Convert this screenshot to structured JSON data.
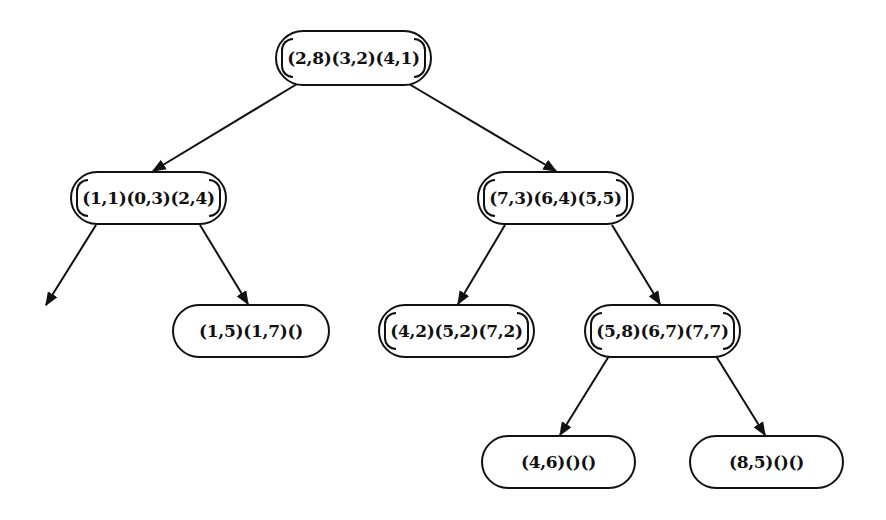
{
  "diagram": {
    "type": "tree",
    "colors": {
      "stroke": "#111111",
      "background": "#ffffff",
      "text": "#111111"
    },
    "nodes": [
      {
        "id": "root",
        "label": "(2,8)(3,2)(4,1)",
        "full": true,
        "x": 275,
        "y": 30,
        "w": 157,
        "h": 56
      },
      {
        "id": "L",
        "label": "(1,1)(0,3)(2,4)",
        "full": true,
        "x": 70,
        "y": 171,
        "w": 157,
        "h": 54
      },
      {
        "id": "R",
        "label": "(7,3)(6,4)(5,5)",
        "full": true,
        "x": 477,
        "y": 171,
        "w": 157,
        "h": 54
      },
      {
        "id": "LR",
        "label": "(1,5)(1,7)()",
        "full": false,
        "x": 172,
        "y": 304,
        "w": 158,
        "h": 54
      },
      {
        "id": "RL",
        "label": "(4,2)(5,2)(7,2)",
        "full": true,
        "x": 378,
        "y": 304,
        "w": 157,
        "h": 54
      },
      {
        "id": "RR",
        "label": "(5,8)(6,7)(7,7)",
        "full": true,
        "x": 584,
        "y": 304,
        "w": 157,
        "h": 54
      },
      {
        "id": "RRL",
        "label": "(4,6)()()",
        "full": false,
        "x": 481,
        "y": 435,
        "w": 155,
        "h": 54
      },
      {
        "id": "RRR",
        "label": "(8,5)()()",
        "full": false,
        "x": 689,
        "y": 435,
        "w": 155,
        "h": 54
      }
    ],
    "edges": [
      {
        "from": "root",
        "to": "L",
        "x1": 297,
        "y1": 84,
        "x2": 153,
        "y2": 171
      },
      {
        "from": "root",
        "to": "R",
        "x1": 409,
        "y1": 84,
        "x2": 556,
        "y2": 171
      },
      {
        "from": "L",
        "to": null,
        "x1": 96,
        "y1": 225,
        "x2": 46,
        "y2": 305
      },
      {
        "from": "L",
        "to": "LR",
        "x1": 200,
        "y1": 225,
        "x2": 248,
        "y2": 304
      },
      {
        "from": "R",
        "to": "RL",
        "x1": 505,
        "y1": 225,
        "x2": 458,
        "y2": 304
      },
      {
        "from": "R",
        "to": "RR",
        "x1": 612,
        "y1": 225,
        "x2": 660,
        "y2": 304
      },
      {
        "from": "RR",
        "to": "RRL",
        "x1": 609,
        "y1": 356,
        "x2": 560,
        "y2": 435
      },
      {
        "from": "RR",
        "to": "RRR",
        "x1": 716,
        "y1": 356,
        "x2": 765,
        "y2": 435
      }
    ]
  }
}
